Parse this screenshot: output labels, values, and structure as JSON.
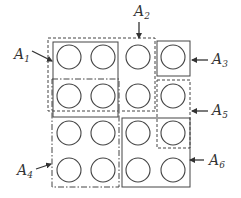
{
  "diagram": {
    "title": "",
    "colors": {
      "stroke": "#444444",
      "text": "#333333",
      "background": "#ffffff"
    },
    "grid": {
      "rows": 4,
      "cols": 4,
      "col_centers_x": [
        69,
        103,
        138,
        173
      ],
      "row_centers_y": [
        57,
        96,
        133,
        170
      ],
      "circle_radius": 12
    },
    "regions": [
      {
        "id": "A1",
        "label": "A",
        "sub": "1",
        "style": "solid",
        "x": 53,
        "y": 42,
        "w": 65,
        "h": 75
      },
      {
        "id": "A2",
        "label": "A",
        "sub": "2",
        "style": "dashed",
        "x": 48,
        "y": 38,
        "w": 107,
        "h": 73
      },
      {
        "id": "A3",
        "label": "A",
        "sub": "3",
        "style": "solid",
        "x": 157,
        "y": 41,
        "w": 33,
        "h": 35
      },
      {
        "id": "A4",
        "label": "A",
        "sub": "4",
        "style": "dashdot",
        "x": 52,
        "y": 79,
        "w": 67,
        "h": 108
      },
      {
        "id": "A5",
        "label": "A",
        "sub": "5",
        "style": "dashed",
        "x": 157,
        "y": 80,
        "w": 33,
        "h": 68
      },
      {
        "id": "A6",
        "label": "A",
        "sub": "6",
        "style": "solid",
        "x": 122,
        "y": 118,
        "w": 68,
        "h": 69
      }
    ],
    "labels": [
      {
        "id": "A1",
        "main": "A",
        "sub": "1",
        "x": 14,
        "y": 59,
        "arrow": [
          32,
          51,
          52,
          61
        ]
      },
      {
        "id": "A2",
        "main": "A",
        "sub": "2",
        "x": 134,
        "y": 16,
        "arrow": [
          139,
          22,
          139,
          38
        ]
      },
      {
        "id": "A3",
        "main": "A",
        "sub": "3",
        "x": 212,
        "y": 64,
        "arrow": [
          208,
          60,
          192,
          60
        ]
      },
      {
        "id": "A4",
        "main": "A",
        "sub": "4",
        "x": 17,
        "y": 175,
        "arrow": [
          36,
          169,
          51,
          164
        ]
      },
      {
        "id": "A5",
        "main": "A",
        "sub": "5",
        "x": 212,
        "y": 115,
        "arrow": [
          208,
          111,
          192,
          111
        ]
      },
      {
        "id": "A6",
        "main": "A",
        "sub": "6",
        "x": 209,
        "y": 165,
        "arrow": [
          204,
          160,
          190,
          160
        ]
      }
    ]
  }
}
